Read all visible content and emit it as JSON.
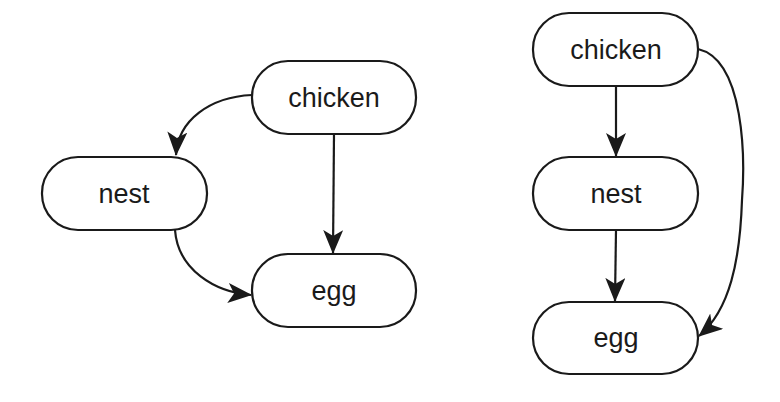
{
  "diagrams": [
    {
      "name": "left-graph",
      "nodes": [
        {
          "id": "chicken",
          "label": "chicken"
        },
        {
          "id": "nest",
          "label": "nest"
        },
        {
          "id": "egg",
          "label": "egg"
        }
      ],
      "edges": [
        {
          "from": "chicken",
          "to": "nest"
        },
        {
          "from": "chicken",
          "to": "egg"
        },
        {
          "from": "nest",
          "to": "egg"
        }
      ]
    },
    {
      "name": "right-graph",
      "nodes": [
        {
          "id": "chicken",
          "label": "chicken"
        },
        {
          "id": "nest",
          "label": "nest"
        },
        {
          "id": "egg",
          "label": "egg"
        }
      ],
      "edges": [
        {
          "from": "chicken",
          "to": "nest"
        },
        {
          "from": "nest",
          "to": "egg"
        },
        {
          "from": "chicken",
          "to": "egg"
        }
      ]
    }
  ],
  "colors": {
    "stroke": "#1a1a1a",
    "background": "#ffffff"
  }
}
